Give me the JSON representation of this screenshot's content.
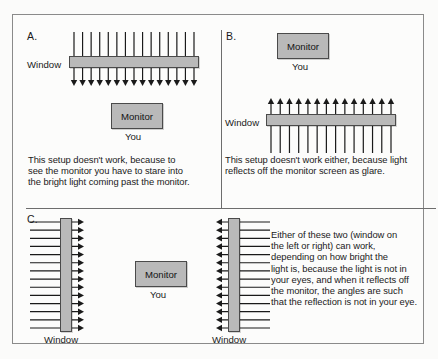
{
  "figure": {
    "background_color": "#fbfbfa",
    "frame_color": "#8a8a8a",
    "monitor_fill": "#b9b9b9",
    "monitor_border": "#4a4a4a",
    "arrow_color": "#1a1a1a"
  },
  "panels": {
    "a": {
      "letter": "A.",
      "window_label": "Window",
      "monitor_label": "Monitor",
      "you_label": "You",
      "ray_count": 15,
      "ray_direction": "down",
      "caption": "This setup doesn't work, because to\nsee the monitor you have to stare into\nthe bright light coming past the monitor."
    },
    "b": {
      "letter": "B.",
      "window_label": "Window",
      "monitor_label": "Monitor",
      "you_label": "You",
      "ray_count": 14,
      "ray_direction": "up",
      "caption": "This setup doesn't work either, because light\nreflects off the monitor screen as glare."
    },
    "c": {
      "letter": "C.",
      "left_window_label": "Window",
      "right_window_label": "Window",
      "monitor_label": "Monitor",
      "you_label": "You",
      "left_ray_count": 14,
      "left_ray_direction": "right",
      "right_ray_count": 14,
      "right_ray_direction": "left",
      "caption": "Either of these two (window on\nthe left or right) can work,\ndepending on how bright the\nlight is, because the light is not in\nyour eyes, and when it reflects off\nthe monitor, the angles are such\nthat the reflection is not in your eye."
    }
  }
}
